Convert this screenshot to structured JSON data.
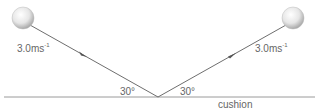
{
  "diagram": {
    "incoming_speed": "3.0ms",
    "incoming_unit_exp": "-1",
    "outgoing_speed": "3.0ms",
    "outgoing_unit_exp": "-1",
    "angle_in": "30°",
    "angle_out": "30°",
    "surface_label": "cushion"
  }
}
